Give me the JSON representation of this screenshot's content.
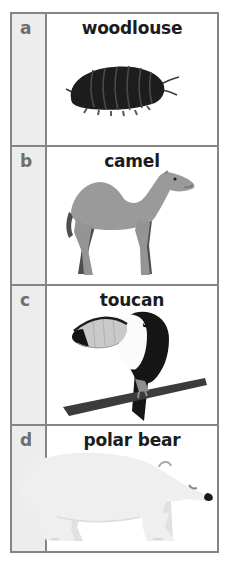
{
  "window": {
    "width": 228,
    "height": 572,
    "background": "#ffffff"
  },
  "worksheet": {
    "rows": [
      {
        "letter": "a",
        "label": "woodlouse",
        "illustration": "woodlouse-illustration"
      },
      {
        "letter": "b",
        "label": "camel",
        "illustration": "camel-illustration"
      },
      {
        "letter": "c",
        "label": "toucan",
        "illustration": "toucan-illustration"
      },
      {
        "letter": "d",
        "label": "polar bear",
        "illustration": "polar-bear-illustration"
      }
    ],
    "colors": {
      "grid_border": "#858585",
      "letter_cell_bg": "#ededed",
      "letter_text": "#6e6e6e",
      "label_text": "#1c1c1c",
      "woodlouse_body": "#1d1d1d",
      "camel_body": "#9a9a9a",
      "camel_far_limbs": "#4e4e4e",
      "toucan_body": "#161616",
      "toucan_beak": "#c9c9c9",
      "toucan_chest": "#fbfbfb",
      "branch": "#3c3c3c",
      "polar_bear_body": "#efefef",
      "polar_bear_far_legs": "#e1e1e1",
      "nose_black": "#1a1a1a"
    }
  }
}
